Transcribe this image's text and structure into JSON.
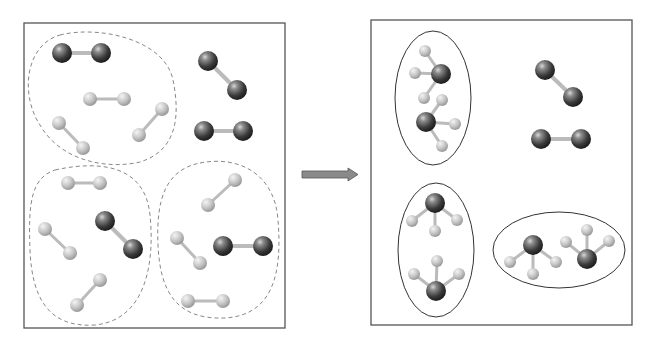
{
  "diagram": {
    "colors": {
      "heavy_atom": "#3a3a3a",
      "light_atom": "#c8c8c8",
      "box_stroke": "#555555",
      "dashed_group": "#888888",
      "arrow_fill": "#8a8a8a"
    },
    "reactants_panel": {
      "label": "",
      "groups": [
        {
          "name": "group-top-left",
          "contains": "1 N2 + 3 H2"
        },
        {
          "name": "group-bottom-left",
          "contains": "1 N2 + 3 H2"
        },
        {
          "name": "group-bottom-right",
          "contains": "1 N2 + 3 H2"
        }
      ],
      "unreacted": "2 N2"
    },
    "arrow": {
      "direction": "right"
    },
    "products_panel": {
      "groups": [
        {
          "name": "product-group-1",
          "contains": "2 NH3"
        },
        {
          "name": "product-group-2",
          "contains": "2 NH3"
        },
        {
          "name": "product-group-3",
          "contains": "2 NH3"
        }
      ],
      "leftover": "2 N2"
    }
  }
}
